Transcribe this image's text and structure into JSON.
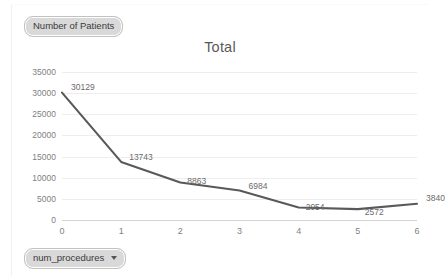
{
  "app": {
    "measure_chip": {
      "label": "Number of Patients",
      "icon": "pivot-field-icon"
    },
    "field_chip": {
      "label": "num_procedures",
      "icon": "chevron-down-icon"
    }
  },
  "chart_data": {
    "type": "line",
    "title": "Total",
    "xlabel": "",
    "ylabel": "",
    "x": [
      0,
      1,
      2,
      3,
      4,
      5,
      6
    ],
    "categories": [
      "0",
      "1",
      "2",
      "3",
      "4",
      "5",
      "6"
    ],
    "values": [
      30129,
      13743,
      8863,
      6984,
      2954,
      2572,
      3840
    ],
    "point_labels": [
      "30129",
      "13743",
      "8863",
      "6984",
      "2954",
      "2572",
      "3840"
    ],
    "series": [
      {
        "name": "Total",
        "values": [
          30129,
          13743,
          8863,
          6984,
          2954,
          2572,
          3840
        ],
        "color": "#595959"
      }
    ],
    "ylim": [
      0,
      35000
    ],
    "xlim": [
      0,
      6
    ],
    "ytick_labels": [
      "0",
      "5000",
      "10000",
      "15000",
      "20000",
      "25000",
      "30000",
      "35000"
    ],
    "yticks": [
      0,
      5000,
      10000,
      15000,
      20000,
      25000,
      30000,
      35000
    ],
    "grid": "horizontal",
    "legend": "none",
    "line_color": "#595959",
    "grid_color": "#ededed",
    "axis_color": "#d4d4d4",
    "label_color": "#7f7f7f"
  }
}
